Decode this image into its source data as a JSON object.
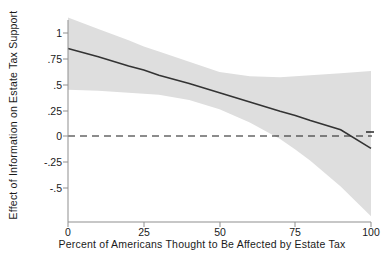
{
  "chart_data": {
    "type": "line",
    "title": "",
    "subtitle": "",
    "xlabel": "Percent of Americans Thought to Be Affected by Estate Tax",
    "ylabel": "Effect of Information on Estate Tax Support",
    "xlim": [
      0,
      100
    ],
    "ylim": [
      -0.75,
      1.15
    ],
    "xticks": [
      0,
      25,
      50,
      75,
      100
    ],
    "xticklabels": [
      "0",
      "25",
      "50",
      "75",
      "100"
    ],
    "yticks": [
      1,
      0.75,
      0.5,
      0.25,
      0,
      -0.25,
      -0.5
    ],
    "yticklabels": [
      "1",
      ".75",
      ".5",
      ".25",
      "0",
      "-.25",
      "-.5"
    ],
    "grid": false,
    "legend": null,
    "series": [
      {
        "name": "Marginal effect of information",
        "type": "line",
        "color": "#333333",
        "x": [
          0,
          10,
          20,
          25,
          30,
          40,
          50,
          60,
          70,
          75,
          80,
          90,
          100
        ],
        "values": [
          0.85,
          0.77,
          0.68,
          0.64,
          0.59,
          0.51,
          0.42,
          0.33,
          0.24,
          0.2,
          0.15,
          0.06,
          -0.12
        ]
      },
      {
        "name": "95% confidence interval",
        "type": "band",
        "color": "#dedede",
        "x": [
          0,
          10,
          20,
          25,
          30,
          40,
          50,
          60,
          70,
          75,
          80,
          90,
          100
        ],
        "upper": [
          1.15,
          1.04,
          0.93,
          0.87,
          0.82,
          0.72,
          0.62,
          0.58,
          0.57,
          0.58,
          0.59,
          0.61,
          0.63
        ],
        "lower": [
          0.45,
          0.44,
          0.42,
          0.41,
          0.4,
          0.35,
          0.26,
          0.13,
          -0.03,
          -0.13,
          -0.24,
          -0.49,
          -0.78
        ]
      }
    ],
    "reference_lines": [
      {
        "name": "zero-line",
        "orientation": "horizontal",
        "value": 0,
        "style": "dashed",
        "color": "#1a1a1a"
      }
    ],
    "annotations": []
  },
  "axes": {
    "y_title": "Effect of Information on Estate Tax Support",
    "x_title": "Percent of Americans Thought to Be Affected by Estate Tax",
    "y_tick_0": "1",
    "y_tick_1": ".75",
    "y_tick_2": ".5",
    "y_tick_3": ".25",
    "y_tick_4": "0",
    "y_tick_5": "-.25",
    "y_tick_6": "-.5",
    "x_tick_0": "0",
    "x_tick_1": "25",
    "x_tick_2": "50",
    "x_tick_3": "75",
    "x_tick_4": "100"
  },
  "colors": {
    "band": "#dedede",
    "line": "#333333",
    "axis": "#8f8f8f",
    "text": "#1a1a1a",
    "background": "#ffffff"
  }
}
